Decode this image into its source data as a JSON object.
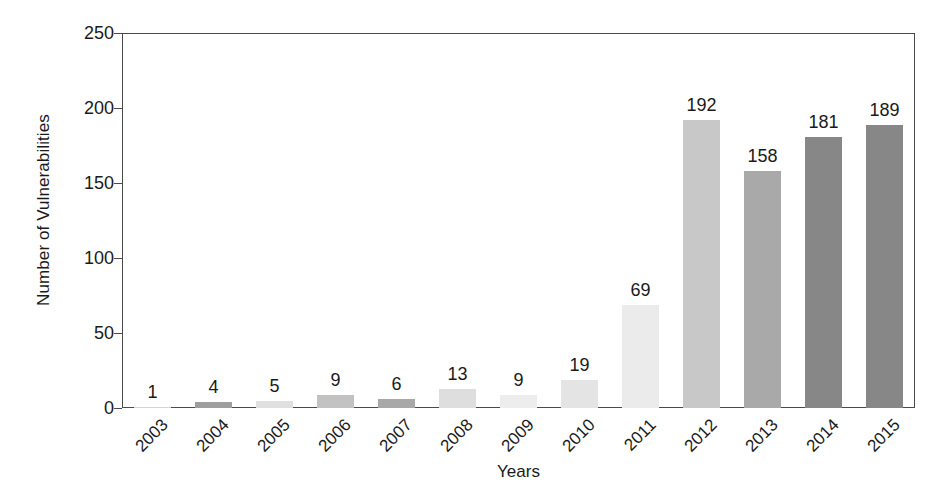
{
  "chart_data": {
    "type": "bar",
    "title": "",
    "subtitle": "",
    "xlabel": "Years",
    "ylabel": "Number of Vulnerabilities",
    "categories": [
      "2003",
      "2004",
      "2005",
      "2006",
      "2007",
      "2008",
      "2009",
      "2010",
      "2011",
      "2012",
      "2013",
      "2014",
      "2015"
    ],
    "values": [
      1,
      4,
      5,
      9,
      6,
      13,
      9,
      19,
      69,
      192,
      158,
      181,
      189
    ],
    "value_labels": [
      "1",
      "4",
      "5",
      "9",
      "6",
      "13",
      "9",
      "19",
      "69",
      "192",
      "158",
      "181",
      "189"
    ],
    "bar_colors": [
      "#d4d4d4",
      "#9e9e9e",
      "#e0e0e0",
      "#c2c2c2",
      "#a8a8a8",
      "#dedede",
      "#ededed",
      "#e4e4e4",
      "#ebebeb",
      "#c8c8c8",
      "#a9a9a9",
      "#878787",
      "#878787"
    ],
    "ylim": [
      0,
      250
    ],
    "yticks": [
      0,
      50,
      100,
      150,
      200,
      250
    ],
    "ytick_labels": [
      "0",
      "50",
      "100",
      "150",
      "200",
      "250"
    ],
    "grid": false,
    "legend": false,
    "legend_position": "none",
    "axis_color": "#4a4a4a",
    "text_color": "#1a1a1a",
    "background_color": "#ffffff",
    "xtick_rotation_degrees": 45
  }
}
